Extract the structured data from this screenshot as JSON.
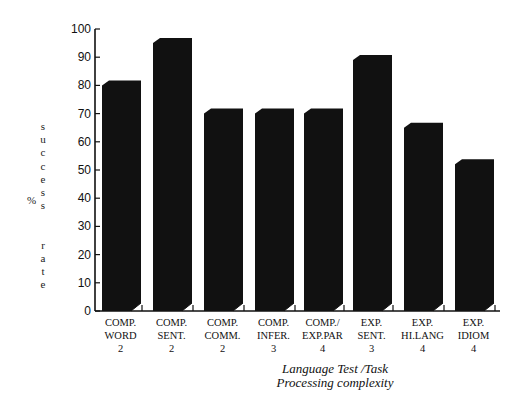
{
  "chart_data": {
    "type": "bar",
    "title": "",
    "categories": [
      [
        "COMP.",
        "WORD",
        "2"
      ],
      [
        "COMP.",
        "SENT.",
        "2"
      ],
      [
        "COMP.",
        "COMM.",
        "2"
      ],
      [
        "COMP.",
        "INFER.",
        "3"
      ],
      [
        "COMP./",
        "EXP.PAR",
        "4"
      ],
      [
        "EXP.",
        "SENT.",
        "3"
      ],
      [
        "EXP.",
        "HI.LANG",
        "4"
      ],
      [
        "EXP.",
        "IDIOM",
        "4"
      ]
    ],
    "values": [
      80,
      95,
      70,
      70,
      70,
      89,
      65,
      52
    ],
    "ylabel": "% success rate",
    "ylabel_letters": [
      "s",
      "u",
      "c",
      "c",
      "e",
      "s",
      "s",
      "",
      "",
      "r",
      "a",
      "t",
      "e"
    ],
    "ylabel_prefix": "%",
    "xlabel_line1": "Language  Test /Task",
    "xlabel_line2": "Processing  complexity",
    "ylim": [
      0,
      100
    ],
    "yticks": [
      0,
      10,
      20,
      30,
      40,
      50,
      60,
      70,
      80,
      90,
      100
    ],
    "grid": false,
    "legend": null,
    "bar_color": "#111111"
  }
}
